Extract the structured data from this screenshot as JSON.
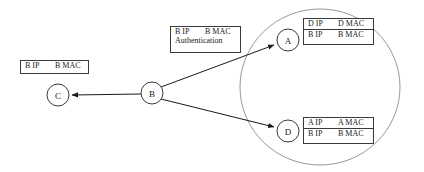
{
  "figure": {
    "background_color": "#ffffff",
    "stroke_color": "#3a3a3a",
    "subnet_outline_color": "#8c8c8c"
  },
  "nodes": [
    {
      "id": "c",
      "label": "C",
      "cx": 58,
      "cy": 95
    },
    {
      "id": "b",
      "label": "B",
      "cx": 152,
      "cy": 93
    },
    {
      "id": "a",
      "label": "A",
      "cx": 288,
      "cy": 40
    },
    {
      "id": "d",
      "label": "D",
      "cx": 288,
      "cy": 131
    }
  ],
  "edges": [
    {
      "id": "b-to-c",
      "from": "B",
      "to": "C",
      "arrow": "to-c"
    },
    {
      "id": "b-to-a",
      "from": "B",
      "to": "A",
      "arrow": "to-a"
    },
    {
      "id": "b-to-d",
      "from": "B",
      "to": "D",
      "arrow": "to-d"
    }
  ],
  "subnet": {
    "name": "subnet-ellipse",
    "cx": 320,
    "cy": 87,
    "rx": 80,
    "ry": 78
  },
  "boxes": {
    "c_entry": {
      "name": "c-arp-entry-box",
      "rows": [
        {
          "ip": "B IP",
          "mac": "B MAC"
        }
      ]
    },
    "auth_packet": {
      "name": "authentication-packet-box",
      "line1_ip": "B IP",
      "line1_mac": "B MAC",
      "line2": "Authentication"
    },
    "a_table": {
      "name": "a-arp-table",
      "rows": [
        {
          "ip": "D IP",
          "mac": "D MAC"
        },
        {
          "ip": "B IP",
          "mac": "B MAC"
        }
      ]
    },
    "d_table": {
      "name": "d-arp-table",
      "rows": [
        {
          "ip": "A IP",
          "mac": "A MAC"
        },
        {
          "ip": "B IP",
          "mac": "B MAC"
        }
      ]
    }
  }
}
